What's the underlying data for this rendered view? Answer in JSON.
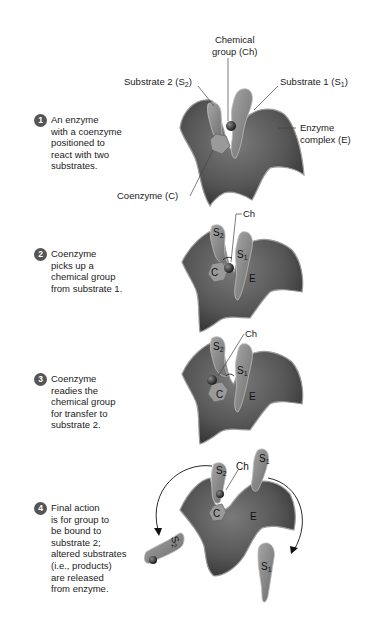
{
  "diagram": {
    "type": "process-steps",
    "palette": {
      "enzyme": "#5a5a5a",
      "enzyme_rim": "#8a8a8a",
      "substrate": "#8c8c8c",
      "coenzyme": "#9a9a9a",
      "chem_group": "#3a3a3a",
      "step_badge": "#555555",
      "text": "#222222"
    },
    "labels": {
      "chemical_group": [
        "Chemical",
        "group (Ch)"
      ],
      "substrate2": "Substrate 2 (S",
      "substrate2_sub": "2",
      "substrate1": "Substrate 1 (S",
      "substrate1_sub": "1",
      "enzyme_complex": [
        "Enzyme",
        "complex (E)"
      ],
      "coenzyme": "Coenzyme (C)",
      "ch": "Ch",
      "s1": "S",
      "s2": "S",
      "sub1": "1",
      "sub2": "2",
      "c": "C",
      "e": "E"
    },
    "steps": [
      {
        "num": "1",
        "text": "An enzyme\nwith a coenzyme\npositioned to\nreact with two\nsubstrates."
      },
      {
        "num": "2",
        "text": "Coenzyme\npicks up a\nchemical group\nfrom substrate 1."
      },
      {
        "num": "3",
        "text": "Coenzyme\nreadies the\nchemical group\nfor transfer to\nsubstrate 2."
      },
      {
        "num": "4",
        "text": "Final action\nis for group to\nbe bound to\nsubstrate 2;\naltered substrates\n(i.e., products)\nare released\nfrom enzyme."
      }
    ]
  }
}
